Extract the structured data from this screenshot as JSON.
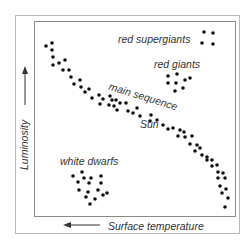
{
  "axes": {
    "y_label": "Luminosity",
    "y_arrow": "up",
    "x_label": "Surface temperature",
    "x_arrow": "left"
  },
  "regions": {
    "red_supergiants": "red supergiants",
    "red_giants": "red giants",
    "main_sequence": "main sequence",
    "sun": "Sun",
    "white_dwarfs": "white dwarfs"
  },
  "colors": {
    "dot": "#111111",
    "text": "#333333",
    "frame": "#8a8a8a"
  },
  "dots": {
    "red_supergiants": [
      [
        204,
        32
      ],
      [
        213,
        33
      ],
      [
        202,
        43
      ],
      [
        213,
        44
      ]
    ],
    "red_giants": [
      [
        168,
        76
      ],
      [
        177,
        74
      ],
      [
        185,
        80
      ],
      [
        190,
        78
      ],
      [
        168,
        83
      ],
      [
        176,
        83
      ],
      [
        183,
        88
      ],
      [
        175,
        91
      ]
    ],
    "white_dwarfs": [
      [
        73,
        176
      ],
      [
        82,
        172
      ],
      [
        84,
        178
      ],
      [
        91,
        178
      ],
      [
        101,
        176
      ],
      [
        78,
        182
      ],
      [
        89,
        183
      ],
      [
        101,
        183
      ],
      [
        79,
        190
      ],
      [
        88,
        192
      ],
      [
        98,
        190
      ],
      [
        86,
        197
      ],
      [
        95,
        199
      ],
      [
        103,
        195
      ],
      [
        107,
        193
      ],
      [
        90,
        204
      ]
    ],
    "main_sequence": [
      [
        46,
        46
      ],
      [
        52,
        43
      ],
      [
        52,
        50
      ],
      [
        53,
        57
      ],
      [
        53,
        65
      ],
      [
        59,
        63
      ],
      [
        65,
        60
      ],
      [
        63,
        70
      ],
      [
        69,
        70
      ],
      [
        71,
        77
      ],
      [
        80,
        80
      ],
      [
        74,
        84
      ],
      [
        81,
        87
      ],
      [
        89,
        89
      ],
      [
        85,
        92
      ],
      [
        99,
        95
      ],
      [
        92,
        98
      ],
      [
        110,
        96
      ],
      [
        103,
        99
      ],
      [
        112,
        100
      ],
      [
        100,
        104
      ],
      [
        116,
        100
      ],
      [
        109,
        105
      ],
      [
        120,
        103
      ],
      [
        114,
        106
      ],
      [
        126,
        103
      ],
      [
        117,
        110
      ],
      [
        128,
        111
      ],
      [
        137,
        108
      ],
      [
        133,
        113
      ],
      [
        140,
        116
      ],
      [
        151,
        115
      ],
      [
        150,
        121
      ],
      [
        157,
        120
      ],
      [
        163,
        125
      ],
      [
        168,
        129
      ],
      [
        173,
        128
      ],
      [
        180,
        130
      ],
      [
        184,
        132
      ],
      [
        178,
        136
      ],
      [
        185,
        137
      ],
      [
        192,
        136
      ],
      [
        190,
        144
      ],
      [
        197,
        145
      ],
      [
        200,
        148
      ],
      [
        195,
        151
      ],
      [
        202,
        155
      ],
      [
        207,
        157
      ],
      [
        212,
        160
      ],
      [
        207,
        160
      ],
      [
        217,
        165
      ],
      [
        212,
        166
      ],
      [
        218,
        172
      ],
      [
        223,
        173
      ],
      [
        218,
        178
      ],
      [
        225,
        178
      ],
      [
        220,
        186
      ],
      [
        226,
        189
      ],
      [
        222,
        193
      ],
      [
        228,
        198
      ],
      [
        225,
        207
      ]
    ]
  }
}
